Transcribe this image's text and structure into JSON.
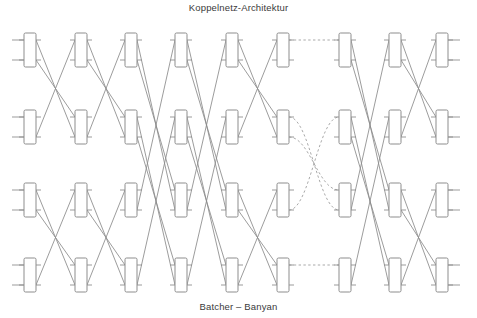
{
  "title": "Koppelnetz-Architektur",
  "caption": "Batcher – Banyan",
  "colors": {
    "line": "#8a8a8a",
    "dashed_line": "#9a9a9a",
    "switch_stroke": "#8d8d8d",
    "switch_fill": "#ffffff",
    "text": "#3a3a3a",
    "background": "#ffffff"
  },
  "diagram": {
    "type": "switching-fabric",
    "name": "Batcher-Banyan network",
    "stage_count": 9,
    "row_count": 4,
    "ports_per_switch": 2,
    "sections": [
      {
        "name": "Batcher sorter",
        "stages": [
          1,
          2,
          3,
          4,
          5,
          6
        ]
      },
      {
        "name": "shuffle interconnect",
        "stages": [],
        "style": "dashed"
      },
      {
        "name": "Banyan router",
        "stages": [
          7,
          8,
          9
        ]
      }
    ],
    "geometry": {
      "width": 477,
      "height": 318,
      "switch_box_width": 12,
      "switch_box_height": 34,
      "switch_corner_radius": 1.5,
      "stub_length": 12,
      "column_centers": [
        30,
        81,
        131,
        181,
        232,
        283,
        345,
        395,
        442
      ],
      "row_centers": [
        50,
        127,
        200,
        275
      ],
      "port_offset": 10
    },
    "stage_links": [
      {
        "stage": 1,
        "style": "solid",
        "pattern": "cross-adjacent-pairs",
        "edges": [
          [
            0,
            1
          ],
          [
            1,
            0
          ],
          [
            2,
            3
          ],
          [
            3,
            2
          ]
        ]
      },
      {
        "stage": 2,
        "style": "solid",
        "pattern": "cross-adjacent-pairs",
        "edges": [
          [
            0,
            1
          ],
          [
            1,
            0
          ],
          [
            2,
            3
          ],
          [
            3,
            2
          ]
        ]
      },
      {
        "stage": 3,
        "style": "solid",
        "pattern": "cross-span-two",
        "edges": [
          [
            0,
            2
          ],
          [
            1,
            3
          ],
          [
            2,
            0
          ],
          [
            3,
            1
          ]
        ]
      },
      {
        "stage": 4,
        "style": "solid",
        "pattern": "cross-span-two",
        "edges": [
          [
            0,
            2
          ],
          [
            1,
            3
          ],
          [
            2,
            0
          ],
          [
            3,
            1
          ]
        ]
      },
      {
        "stage": 5,
        "style": "solid",
        "pattern": "cross-adjacent-pairs",
        "edges": [
          [
            0,
            1
          ],
          [
            1,
            0
          ],
          [
            2,
            3
          ],
          [
            3,
            2
          ]
        ]
      },
      {
        "stage": 6,
        "style": "dashed",
        "pattern": "perfect-shuffle",
        "edges": [
          [
            0,
            0
          ],
          [
            1,
            2
          ],
          [
            2,
            1
          ],
          [
            3,
            3
          ]
        ]
      },
      {
        "stage": 7,
        "style": "solid",
        "pattern": "cross-span-two",
        "edges": [
          [
            0,
            2
          ],
          [
            1,
            3
          ],
          [
            2,
            0
          ],
          [
            3,
            1
          ]
        ]
      },
      {
        "stage": 8,
        "style": "solid",
        "pattern": "cross-adjacent-pairs",
        "edges": [
          [
            0,
            1
          ],
          [
            1,
            0
          ],
          [
            2,
            3
          ],
          [
            3,
            2
          ]
        ]
      }
    ]
  }
}
